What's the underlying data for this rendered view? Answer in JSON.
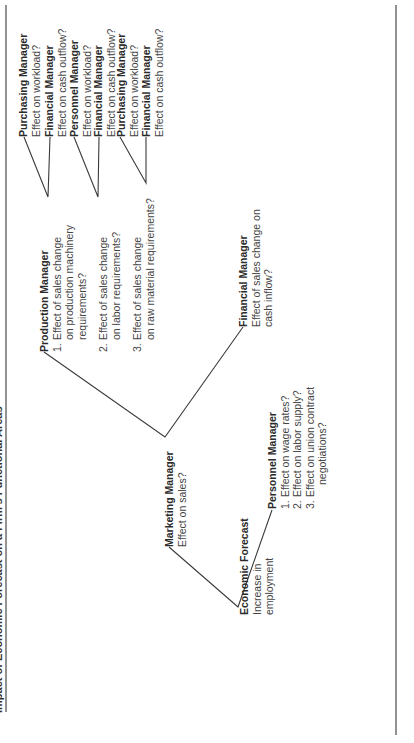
{
  "title": "Impact of Economic Forecast on a Firm's Functional Areas",
  "root": {
    "title": "Economic Forecast",
    "desc": [
      "Increase in",
      "employment"
    ]
  },
  "marketing": {
    "title": "Marketing Manager",
    "desc": "Effect on sales?"
  },
  "personnel": {
    "title": "Personnel Manager",
    "items": [
      {
        "n": "1.",
        "text": "Effect on wage rates?"
      },
      {
        "n": "2.",
        "text": "Effect on labor supply?"
      },
      {
        "n": "3.",
        "text": "Effect on union contract"
      },
      {
        "n": "",
        "text": "negotiations?"
      }
    ]
  },
  "production": {
    "title": "Production Manager",
    "items": [
      {
        "n": "1.",
        "lines": [
          "Effect of sales change",
          "on production machinery",
          "requirements?"
        ]
      },
      {
        "n": "2.",
        "lines": [
          "Effect of sales change",
          "on labor requirements?"
        ]
      },
      {
        "n": "3.",
        "lines": [
          "Effect of sales change",
          "on raw material requirements?"
        ]
      }
    ]
  },
  "financial_sales": {
    "title": "Financial Manager",
    "desc": [
      "Effect of sales change on",
      "cash inflow?"
    ]
  },
  "leaves": [
    {
      "title": "Purchasing Manager",
      "desc": "Effect on workload?"
    },
    {
      "title": "Financial Manager",
      "desc": "Effect on cash outflow?"
    },
    {
      "title": "Personnel Manager",
      "desc": "Effect on workload?"
    },
    {
      "title": "Financial Manager",
      "desc": "Effect on cash outflow?"
    },
    {
      "title": "Purchasing Manager",
      "desc": "Effect on workload?"
    },
    {
      "title": "Financial Manager",
      "desc": "Effect on cash outflow?"
    }
  ]
}
